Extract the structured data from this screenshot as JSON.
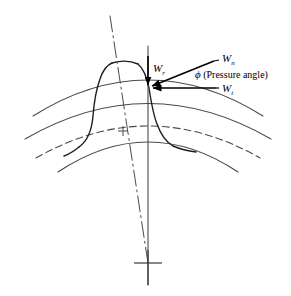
{
  "figure": {
    "background_color": "#ffffff",
    "line_color": "#3a3a3a",
    "dark_line_color": "#1a1a1a",
    "text_color": "#000000"
  },
  "labels": {
    "normal_force": {
      "symbol": "W",
      "subscript": "n",
      "name": "normal-force-label",
      "x": 222,
      "y": 58
    },
    "radial_force": {
      "symbol": "W",
      "subscript": "r",
      "name": "radial-force-label",
      "x": 153,
      "y": 70
    },
    "tangential_force": {
      "symbol": "W",
      "subscript": "t",
      "name": "tangential-force-label",
      "x": 222,
      "y": 90
    },
    "pressure_angle": {
      "symbol": "ϕ",
      "text": " (Pressure angle)",
      "name": "pressure-angle-label",
      "x": 196,
      "y": 76
    }
  },
  "geometry": {
    "pitch_point": {
      "x": 148,
      "y": 88
    },
    "gear_center_mark": {
      "x": 148,
      "y": 263
    },
    "root_circle_mark": {
      "x": 123,
      "y": 131
    },
    "circles": [
      {
        "name": "addendum-circle",
        "style": "solid"
      },
      {
        "name": "pitch-circle",
        "style": "solid"
      },
      {
        "name": "root-circle",
        "style": "dashed"
      },
      {
        "name": "dedendum-circle",
        "style": "solid"
      }
    ],
    "center_lines": [
      {
        "name": "tooth-centerline",
        "style": "dash-dot"
      },
      {
        "name": "radial-centerline",
        "style": "solid"
      },
      {
        "name": "pitch-point-radial-line",
        "style": "solid"
      }
    ],
    "force_vectors": [
      {
        "name": "normal-force-vector",
        "direction": "into-pitch-point-from-upper-right"
      },
      {
        "name": "radial-force-vector",
        "direction": "downward"
      },
      {
        "name": "tangential-force-vector",
        "direction": "leftward"
      }
    ]
  }
}
